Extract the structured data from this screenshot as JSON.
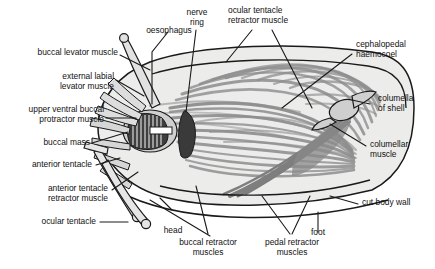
{
  "figure": {
    "background_color": "#ffffff",
    "outline_color": "#1a1a1a",
    "haemocoel_color": "#ececeb",
    "muscle_color": "#8d8d8d",
    "muscle_dark_color": "#6e6e6e",
    "nerve_ring_color": "#3a3a3a",
    "buccal_mass_color": "#5a5a5a",
    "text_color": "#111111"
  },
  "labels": {
    "oesophagus": "oesophagus",
    "nerve_ring_line1": "nerve",
    "nerve_ring_line2": "ring",
    "ocular_tentacle_retractor_line1": "ocular tentacle",
    "ocular_tentacle_retractor_line2": "retractor muscle",
    "cephalopedal_line1": "cephalopedal",
    "cephalopedal_line2": "haemocoel",
    "buccal_levator": "buccal levator muscle",
    "external_labial_line1": "external labial",
    "external_labial_line2": "levator muscle",
    "upper_ventral_line1": "upper ventral buccal",
    "upper_ventral_line2": "protractor muscle",
    "columella_line1": "columella",
    "columella_line2": "of shell",
    "columellar_muscle_line1": "columellar",
    "columellar_muscle_line2": "muscle",
    "buccal_mass": "buccal mass",
    "anterior_tentacle": "anterior tentacle",
    "anterior_tentacle_retractor_line1": "anterior tentacle",
    "anterior_tentacle_retractor_line2": "retractor muscle",
    "ocular_tentacle": "ocular tentacle",
    "cut_body_wall": "cut body wall",
    "head": "head",
    "foot": "foot",
    "buccal_retractor_line1": "buccal retractor",
    "buccal_retractor_line2": "muscles",
    "pedal_retractor_line1": "pedal retractor",
    "pedal_retractor_line2": "muscles"
  }
}
